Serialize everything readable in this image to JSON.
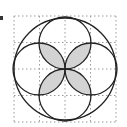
{
  "figure": {
    "grid": {
      "cols": 4,
      "rows": 4,
      "x0": 14,
      "y0": 16,
      "x1": 116,
      "y1": 122,
      "line_color": "#999999",
      "style": "dotted"
    },
    "big_circle": {
      "cx": 65,
      "cy": 69,
      "r": 51
    },
    "small_circles": [
      {
        "name": "top",
        "cx": 65,
        "cy": 43,
        "r": 26
      },
      {
        "name": "bottom",
        "cx": 65,
        "cy": 95,
        "r": 26
      },
      {
        "name": "left",
        "cx": 39,
        "cy": 69,
        "r": 26
      },
      {
        "name": "right",
        "cx": 91,
        "cy": 69,
        "r": 26
      }
    ],
    "shade_color": "#d3d3d3",
    "stroke_color": "#222222"
  }
}
